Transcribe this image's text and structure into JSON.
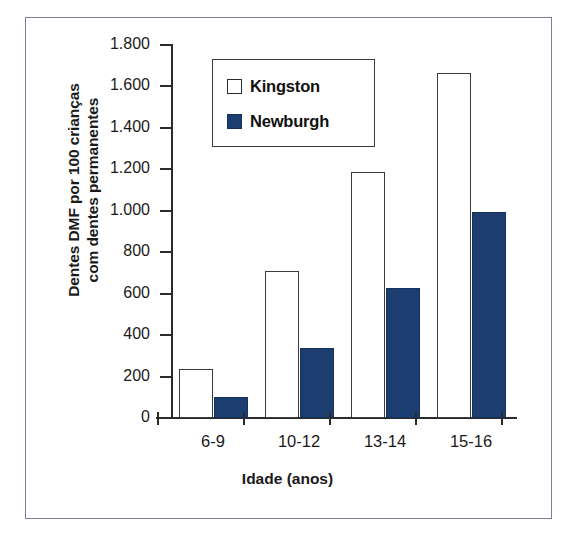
{
  "chart_data": {
    "type": "bar",
    "title": "",
    "xlabel": "Idade (anos)",
    "ylabel_line1": "Dentes DMF por 100 crianças",
    "ylabel_line2": "com dentes permanentes",
    "categories": [
      "6-9",
      "10-12",
      "13-14",
      "15-16"
    ],
    "series": [
      {
        "name": "Kingston",
        "color": "#ffffff",
        "values": [
          236,
          709,
          1187,
          1665
        ]
      },
      {
        "name": "Newburgh",
        "color": "#1b3d70",
        "values": [
          101,
          338,
          628,
          994
        ]
      }
    ],
    "ylim": [
      0,
      1800
    ],
    "ytick_values": [
      0,
      200,
      400,
      600,
      800,
      1000,
      1200,
      1400,
      1600,
      1800
    ],
    "ytick_labels": [
      "0",
      "200",
      "400",
      "600",
      "800",
      "1.000",
      "1.200",
      "1.400",
      "1.600",
      "1.800"
    ],
    "grid": false,
    "legend_position": "top-center",
    "legend_entries": [
      {
        "label": "Kingston",
        "swatch": "open-square"
      },
      {
        "label": "Newburgh",
        "swatch": "filled-square"
      }
    ]
  },
  "colors": {
    "newburgh_fill": "#1b3d70",
    "kingston_fill": "#ffffff",
    "axis": "#2b2b2b",
    "frame_border": "#7b7f99",
    "text": "#1a1a1a"
  }
}
